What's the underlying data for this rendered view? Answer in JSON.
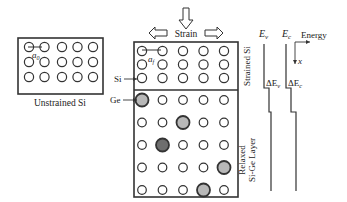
{
  "unstrained": {
    "label": "Unstrained Si",
    "lattice_label_main": "a",
    "lattice_label_sub": "0",
    "rows": 3,
    "cols": 5
  },
  "strained": {
    "strain_label": "Strain",
    "lattice_label_main": "a",
    "lattice_label_sub": "f",
    "top_layer_label": "Strained Si",
    "bottom_layer_label_line1": "Relaxed",
    "bottom_layer_label_line2": "Si-Ge Layer",
    "si_pointer_label": "Si",
    "ge_pointer_label": "Ge",
    "top_rows": 3,
    "bottom_rows": 5,
    "cols": 5,
    "ge_atoms": [
      {
        "row": 0,
        "col": 0,
        "shade": "light"
      },
      {
        "row": 1,
        "col": 2,
        "shade": "light"
      },
      {
        "row": 2,
        "col": 1,
        "shade": "dark"
      },
      {
        "row": 3,
        "col": 4,
        "shade": "light"
      },
      {
        "row": 4,
        "col": 3,
        "shade": "light"
      }
    ]
  },
  "band": {
    "ev_main": "E",
    "ev_sub": "v",
    "ec_main": "E",
    "ec_sub": "c",
    "energy_label": "Energy",
    "x_label": "x",
    "delta_ev_main": "ΔE",
    "delta_ev_sub": "v",
    "delta_ec_main": "ΔE",
    "delta_ec_sub": "c"
  },
  "colors": {
    "line": "#333333",
    "ge_light": "#b8b8b8",
    "ge_dark": "#6e6e6e"
  }
}
